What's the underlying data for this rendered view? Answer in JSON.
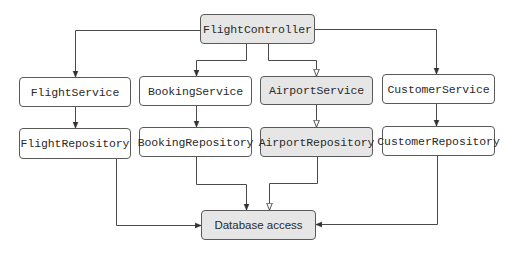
{
  "diagram": {
    "controller": {
      "label": "FlightController",
      "shaded": true
    },
    "services": [
      {
        "label": "FlightService",
        "shaded": false
      },
      {
        "label": "BookingService",
        "shaded": false
      },
      {
        "label": "AirportService",
        "shaded": true
      },
      {
        "label": "CustomerService",
        "shaded": false
      }
    ],
    "repositories": [
      {
        "label": "FlightRepository",
        "shaded": false
      },
      {
        "label": "BookingRepository",
        "shaded": false
      },
      {
        "label": "AirportRepository",
        "shaded": true
      },
      {
        "label": "CustomerRepository",
        "shaded": false
      }
    ],
    "database": {
      "label": "Database access",
      "shaded": true
    },
    "edges": [
      {
        "from": "FlightController",
        "to": "FlightService",
        "arrow": "filled"
      },
      {
        "from": "FlightController",
        "to": "BookingService",
        "arrow": "filled"
      },
      {
        "from": "FlightController",
        "to": "AirportService",
        "arrow": "hollow"
      },
      {
        "from": "FlightController",
        "to": "CustomerService",
        "arrow": "filled"
      },
      {
        "from": "FlightService",
        "to": "FlightRepository",
        "arrow": "filled"
      },
      {
        "from": "BookingService",
        "to": "BookingRepository",
        "arrow": "filled"
      },
      {
        "from": "AirportService",
        "to": "AirportRepository",
        "arrow": "hollow"
      },
      {
        "from": "CustomerService",
        "to": "CustomerRepository",
        "arrow": "filled"
      },
      {
        "from": "FlightRepository",
        "to": "Database access",
        "arrow": "filled"
      },
      {
        "from": "BookingRepository",
        "to": "Database access",
        "arrow": "filled"
      },
      {
        "from": "AirportRepository",
        "to": "Database access",
        "arrow": "hollow"
      },
      {
        "from": "CustomerRepository",
        "to": "Database access",
        "arrow": "filled"
      }
    ],
    "colors": {
      "shaded_fill": "#e6e6e6",
      "plain_fill": "#ffffff",
      "border": "#5a5a5a",
      "line": "#4a4a4a",
      "text": "#2a2a2a"
    }
  }
}
